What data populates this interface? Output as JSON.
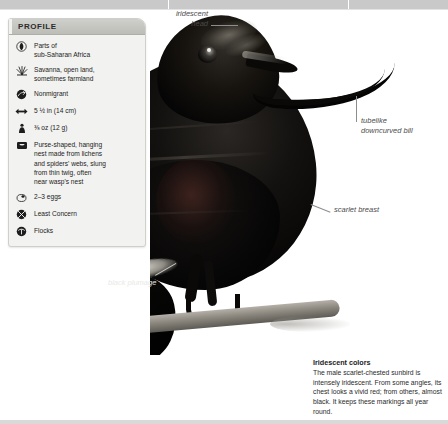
{
  "profile": {
    "title": "PROFILE",
    "rows": [
      {
        "icon": "globe-range-icon",
        "icon_name": "range",
        "text": "Parts of\nsub-Saharan Africa"
      },
      {
        "icon": "grass-habitat-icon",
        "icon_name": "habitat",
        "text": "Savanna, open land,\nsometimes farmland"
      },
      {
        "icon": "migration-icon",
        "icon_name": "migration",
        "text": "Nonmigrant"
      },
      {
        "icon": "length-arrows-icon",
        "icon_name": "length",
        "text": "5 ½ in (14 cm)"
      },
      {
        "icon": "weight-icon",
        "icon_name": "weight",
        "text": "⅜ oz (12 g)"
      },
      {
        "icon": "nest-icon",
        "icon_name": "nest",
        "text": "Purse-shaped, hanging\nnest made from lichens\nand spiders' webs, slung\nfrom thin twig, often\nnear wasp's nest"
      },
      {
        "icon": "egg-icon",
        "icon_name": "eggs",
        "text": "2–3 eggs"
      },
      {
        "icon": "conservation-icon",
        "icon_name": "conservation",
        "text": "Least Concern"
      },
      {
        "icon": "social-icon",
        "icon_name": "social",
        "text": "Flocks"
      }
    ]
  },
  "annotations": [
    {
      "id": "iridescent-head",
      "label": "iridescent\nhead"
    },
    {
      "id": "tubelike-bill",
      "label": "tubelike\ndowncurved bill"
    },
    {
      "id": "scarlet-breast",
      "label": "scarlet breast"
    },
    {
      "id": "black-plumage",
      "label": "black plumage"
    }
  ],
  "caption": {
    "title": "Iridescent colors",
    "body": "The male scarlet-chested sunbird is intensely iridescent. From some angles, its chest looks a vivid red; from others, almost black. It keeps these markings all year round."
  },
  "colors": {
    "page_background": "#ffffff",
    "card_background": "#f2f2f0",
    "card_header": "#c4c4bf",
    "bird_plumage": "#060505",
    "annotation_text": "#4b4b4b",
    "leader_line": "#8d8d8d"
  }
}
